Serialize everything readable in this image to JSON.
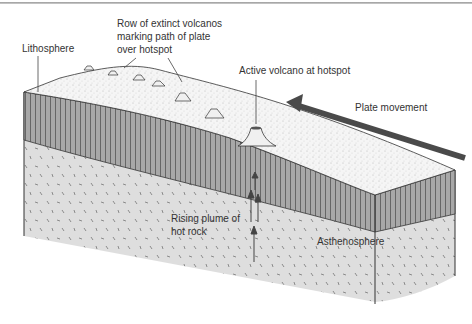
{
  "diagram": {
    "labels": {
      "lithosphere": "Lithosphere",
      "extinct_volcanos": "Row of extinct volcanos\nmarking path of plate\nover hotspot",
      "active_volcano": "Active volcano at hotspot",
      "plate_movement": "Plate movement",
      "rising_plume": "Rising plume of\nhot rock",
      "asthenosphere": "Asthenosphere"
    },
    "colors": {
      "arrow": "#4a4a4a",
      "lithosphere_band": "#9c9c9c",
      "surface": "#f4f4f4",
      "asthenosphere": "#dcdcdc",
      "outline": "#333333",
      "text": "#333333"
    }
  }
}
